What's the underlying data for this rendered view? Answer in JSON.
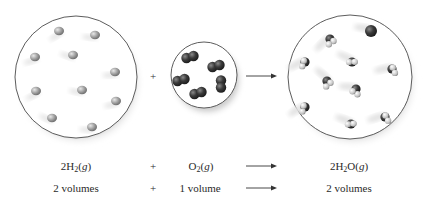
{
  "diagram": {
    "vessels": [
      {
        "id": "hydrogen",
        "species": "H2",
        "cx": 76,
        "cy": 77,
        "r": 61,
        "molecule_count": 10,
        "molecule_color": "#9a9a9a",
        "molecules": [
          [
            59,
            31
          ],
          [
            95,
            35
          ],
          [
            35,
            57
          ],
          [
            73,
            55
          ],
          [
            115,
            72
          ],
          [
            36,
            91
          ],
          [
            82,
            90
          ],
          [
            116,
            101
          ],
          [
            52,
            118
          ],
          [
            92,
            127
          ]
        ]
      },
      {
        "id": "oxygen",
        "species": "O2",
        "cx": 204,
        "cy": 75,
        "r": 33,
        "molecule_count": 5,
        "molecule_color": "#3a3a3a",
        "molecules": [
          [
            190,
            57
          ],
          [
            216,
            66
          ],
          [
            181,
            80
          ],
          [
            221,
            84
          ],
          [
            198,
            93
          ]
        ]
      },
      {
        "id": "water",
        "species": "H2O",
        "cx": 350,
        "cy": 77,
        "r": 62,
        "molecule_count": 10,
        "molecule_color": "#444444",
        "molecules": [
          [
            330,
            40
          ],
          [
            371,
            32
          ],
          [
            305,
            63
          ],
          [
            352,
            63
          ],
          [
            392,
            70
          ],
          [
            327,
            82
          ],
          [
            356,
            90
          ],
          [
            305,
            108
          ],
          [
            351,
            125
          ],
          [
            385,
            118
          ]
        ]
      }
    ],
    "operators": {
      "plus": "+",
      "plus_x": 153,
      "arrow_x1": 246,
      "arrow_x2": 276,
      "y": 76
    }
  },
  "equation": {
    "row1": {
      "reactant1": {
        "coef": "2",
        "formula": "H",
        "sub": "2",
        "rest": "",
        "state": "g"
      },
      "plus": "+",
      "reactant2": {
        "coef": "",
        "formula": "O",
        "sub": "2",
        "rest": "",
        "state": "g"
      },
      "product": {
        "coef": "2",
        "formula": "H",
        "sub": "2",
        "rest": "O",
        "state": "g"
      }
    },
    "row2": {
      "reactant1": "2 volumes",
      "plus": "+",
      "reactant2": "1 volume",
      "product": "2 volumes"
    }
  }
}
